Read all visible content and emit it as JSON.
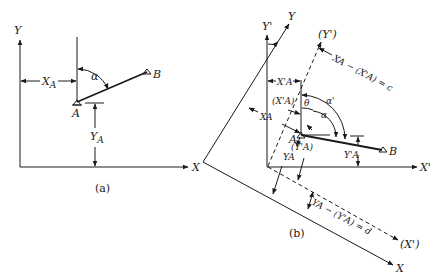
{
  "figure_a": {
    "caption": "(a)",
    "axis_x": "X",
    "axis_y": "Y",
    "point_a": "A",
    "point_b": "B",
    "dim_x": "X",
    "dim_x_sub": "A",
    "dim_y": "Y",
    "dim_y_sub": "A",
    "angle": "α"
  },
  "figure_b": {
    "caption": "(b)",
    "axis_x": "X",
    "axis_y": "Y",
    "axis_x_prime": "X'",
    "axis_y_prime": "Y'",
    "axis_x_prime_paren": "(X')",
    "axis_y_prime_paren": "(Y')",
    "point_a": "A",
    "point_b": "B",
    "angle_theta": "θ",
    "angle_alpha": "α",
    "angle_alpha_prime": "α'",
    "dim_xa_prime": "X'A",
    "dim_xa_prime_paren": "(X'A)",
    "dim_xa": "XA",
    "dim_ya_prime": "Y'A",
    "dim_ya_prime_paren": "(Y'A)",
    "dim_ya": "YA",
    "eq_c": "XA − (X'A) = c",
    "eq_d": "YA − (Y'A) = d"
  }
}
